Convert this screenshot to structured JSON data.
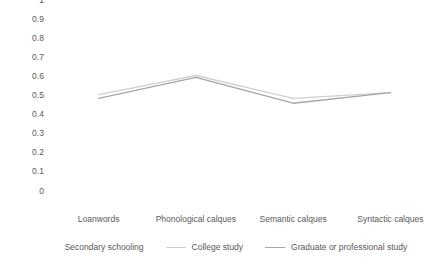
{
  "chart_data": {
    "type": "line",
    "title": "",
    "subtitle": "",
    "xlabel": "",
    "ylabel": "",
    "categories": [
      "Loanwords",
      "Phonological calques",
      "Semantic calques",
      "Syntactic calques"
    ],
    "ylim": [
      0,
      1
    ],
    "yticks": [
      "0",
      "0.1",
      "0.2",
      "0.3",
      "0.4",
      "0.5",
      "0.6",
      "0.7",
      "0.8",
      "0.9",
      "1"
    ],
    "ytick_values": [
      0,
      0.1,
      0.2,
      0.3,
      0.4,
      0.5,
      0.6,
      0.7,
      0.8,
      0.9,
      1
    ],
    "grid": false,
    "legend_position": "bottom",
    "series": [
      {
        "name": "Secondary schooling",
        "values": [
          null,
          null,
          null,
          null
        ],
        "color": "#ffffff",
        "visible": false
      },
      {
        "name": "College study",
        "values": [
          0.62,
          0.72,
          0.6,
          0.63
        ],
        "color": "#d0d0d0",
        "visible": true
      },
      {
        "name": "Graduate or professional study",
        "values": [
          0.6,
          0.71,
          0.575,
          0.63
        ],
        "color": "#a6a6a6",
        "visible": true
      }
    ]
  },
  "axes": {
    "y_tick_labels": [
      "1",
      "0.9",
      "0.8",
      "0.7",
      "0.6",
      "0.5",
      "0.4",
      "0.3",
      "0.2",
      "0.1",
      "0"
    ],
    "x_tick_labels": [
      "Loanwords",
      "Phonological calques",
      "Semantic calques",
      "Syntactic calques"
    ]
  },
  "legend": {
    "items": [
      {
        "label": "Secondary schooling",
        "color": "#ffffff"
      },
      {
        "label": "College study",
        "color": "#d0d0d0"
      },
      {
        "label": "Graduate or professional study",
        "color": "#a6a6a6"
      }
    ]
  },
  "colors": {
    "text": "#595959",
    "background": "#ffffff",
    "series_light": "#d0d0d0",
    "series_dark": "#a6a6a6",
    "series_hidden": "#ffffff"
  }
}
